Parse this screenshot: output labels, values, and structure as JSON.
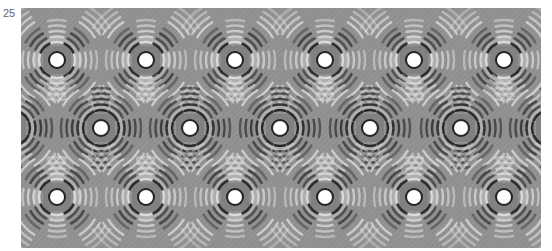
{
  "figure": {
    "panel_label": "25",
    "background_color": "#8f8f8f",
    "center_color": "#ffffff",
    "dark_fringe_color": "#1a1a1a",
    "light_fringe_color": "#e0e0e0",
    "frame": {
      "x": 21,
      "y": 8,
      "width": 520,
      "height": 240
    },
    "rows": [
      {
        "y": 52,
        "centers_x": [
          36,
          125,
          214,
          304,
          393,
          483
        ]
      },
      {
        "y": 120,
        "centers_x": [
          -9,
          80,
          169,
          259,
          349,
          440,
          529
        ]
      },
      {
        "y": 189,
        "centers_x": [
          36,
          125,
          214,
          304,
          393,
          483
        ]
      }
    ]
  }
}
